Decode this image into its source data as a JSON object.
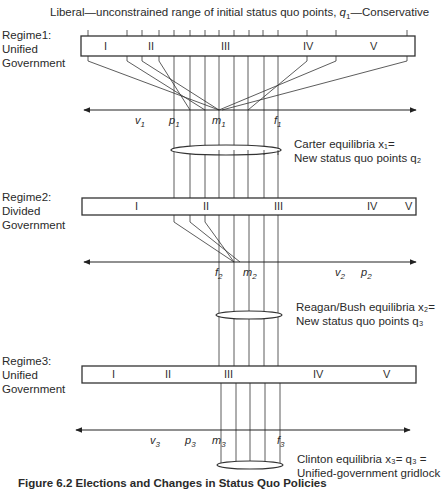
{
  "title": "Liberal—unconstrained range of initial status quo points, q1—Conservative",
  "title_parts": {
    "pre": "Liberal—unconstrained range of initial status quo points, ",
    "q": "q",
    "sub": "1",
    "post": "—Conservative"
  },
  "regimes": [
    {
      "name": "Regime1:",
      "line2": "Unified",
      "line3": "Government",
      "zones": [
        "I",
        "II",
        "III",
        "IV",
        "V"
      ]
    },
    {
      "name": "Regime2:",
      "line2": "Divided",
      "line3": "Government",
      "zones": [
        "I",
        "II",
        "III",
        "IV",
        "V"
      ]
    },
    {
      "name": "Regime3:",
      "line2": "Unified",
      "line3": "Government",
      "zones": [
        "I",
        "II",
        "III",
        "IV",
        "V"
      ]
    }
  ],
  "axes": [
    {
      "points": [
        {
          "b": "v",
          "s": "1"
        },
        {
          "b": "p",
          "s": "1"
        },
        {
          "b": "m",
          "s": "1"
        },
        {
          "b": "f",
          "s": "1"
        }
      ]
    },
    {
      "points": [
        {
          "b": "f",
          "s": "2"
        },
        {
          "b": "m",
          "s": "2"
        },
        {
          "b": "v",
          "s": "2"
        },
        {
          "b": "p",
          "s": "2"
        }
      ]
    },
    {
      "points": [
        {
          "b": "v",
          "s": "3"
        },
        {
          "b": "p",
          "s": "3"
        },
        {
          "b": "m",
          "s": "3"
        },
        {
          "b": "f",
          "s": "3"
        }
      ]
    }
  ],
  "equilibria": [
    {
      "line1": "Carter equilibria x₁=",
      "line2": "New status quo points q₂"
    },
    {
      "line1": "Reagan/Bush equilibria x₂=",
      "line2": "New status quo points q₃"
    },
    {
      "line1": "Clinton equilibria x₃= q₃ =",
      "line2": "Unified-government gridlock"
    }
  ],
  "caption": "Figure 6.2 Elections and Changes in Status Quo Policies"
}
